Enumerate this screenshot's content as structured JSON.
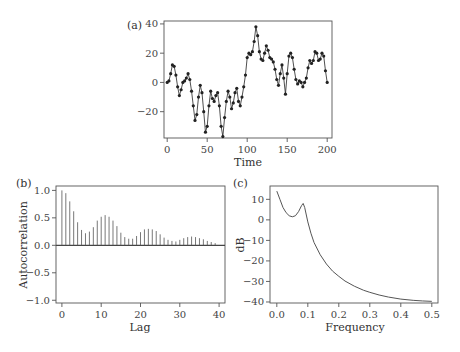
{
  "chart_data": [
    {
      "panel": "(a)",
      "type": "line",
      "title": "",
      "xlabel": "Time",
      "ylabel": "",
      "xlim": [
        -4,
        206
      ],
      "ylim": [
        -38,
        42
      ],
      "xticks": [
        0,
        50,
        100,
        150,
        200
      ],
      "yticks": [
        -20,
        0,
        20,
        40
      ],
      "grid": false,
      "markers": true,
      "x_step": 2,
      "values": [
        0,
        1,
        6,
        12,
        11,
        5,
        -3,
        -9,
        -5,
        0,
        1,
        3,
        6,
        2,
        -6,
        -16,
        -26,
        -22,
        -10,
        -2,
        -7,
        -20,
        -34,
        -30,
        -16,
        -6,
        -11,
        -13,
        -9,
        -7,
        -16,
        -30,
        -37,
        -24,
        -13,
        -6,
        -10,
        -18,
        -14,
        -7,
        -4,
        -13,
        -16,
        -10,
        -3,
        5,
        17,
        20,
        19,
        21,
        28,
        38,
        32,
        21,
        16,
        15,
        20,
        25,
        22,
        17,
        16,
        14,
        9,
        2,
        -2,
        6,
        12,
        3,
        -8,
        6,
        18,
        20,
        17,
        9,
        2,
        -1,
        1,
        0,
        -3,
        0,
        3,
        10,
        15,
        13,
        15,
        21,
        20,
        15,
        16,
        20,
        18,
        8,
        0
      ],
      "series_color": "#222222"
    },
    {
      "panel": "(b)",
      "type": "bar",
      "title": "",
      "xlabel": "Lag",
      "ylabel": "Autocorrelation",
      "xlim": [
        -1.5,
        41.5
      ],
      "ylim": [
        -1.05,
        1.08
      ],
      "xticks": [
        0,
        10,
        20,
        30,
        40
      ],
      "yticks": [
        "1.0",
        "0.5",
        "0.0",
        "-0.5",
        "-1.0"
      ],
      "ytick_values": [
        1.0,
        0.5,
        0.0,
        -0.5,
        -1.0
      ],
      "grid": false,
      "categories": [
        0,
        1,
        2,
        3,
        4,
        5,
        6,
        7,
        8,
        9,
        10,
        11,
        12,
        13,
        14,
        15,
        16,
        17,
        18,
        19,
        20,
        21,
        22,
        23,
        24,
        25,
        26,
        27,
        28,
        29,
        30,
        31,
        32,
        33,
        34,
        35,
        36,
        37,
        38,
        39
      ],
      "values": [
        1.0,
        0.95,
        0.8,
        0.62,
        0.42,
        0.28,
        0.22,
        0.25,
        0.33,
        0.45,
        0.52,
        0.55,
        0.52,
        0.45,
        0.35,
        0.23,
        0.15,
        0.12,
        0.12,
        0.17,
        0.24,
        0.29,
        0.3,
        0.29,
        0.26,
        0.2,
        0.14,
        0.1,
        0.08,
        0.07,
        0.1,
        0.13,
        0.15,
        0.16,
        0.15,
        0.13,
        0.11,
        0.08,
        0.06,
        0.04
      ],
      "series_color": "#555555"
    },
    {
      "panel": "(c)",
      "type": "line",
      "title": "",
      "xlabel": "Frequency",
      "ylabel": "dB",
      "xlim": [
        -0.022,
        0.52
      ],
      "ylim": [
        -40.5,
        16.5
      ],
      "xticks": [
        "0.0",
        "0.1",
        "0.2",
        "0.3",
        "0.4",
        "0.5"
      ],
      "xtick_values": [
        0.0,
        0.1,
        0.2,
        0.3,
        0.4,
        0.5
      ],
      "yticks": [
        10,
        0,
        -10,
        -20,
        -30,
        -40
      ],
      "grid": false,
      "x": [
        0.0,
        0.01,
        0.02,
        0.03,
        0.04,
        0.05,
        0.06,
        0.07,
        0.08,
        0.085,
        0.09,
        0.1,
        0.11,
        0.12,
        0.14,
        0.16,
        0.18,
        0.2,
        0.22,
        0.25,
        0.28,
        0.3,
        0.33,
        0.36,
        0.4,
        0.44,
        0.47,
        0.5
      ],
      "values": [
        14,
        10,
        6,
        3.5,
        2,
        1.5,
        2,
        4,
        7,
        8,
        6,
        -1,
        -6.5,
        -11,
        -17,
        -21.5,
        -25,
        -27.5,
        -29.8,
        -32.3,
        -34.3,
        -35.3,
        -36.6,
        -37.6,
        -38.6,
        -39.2,
        -39.5,
        -39.7
      ],
      "series_color": "#555555"
    }
  ]
}
